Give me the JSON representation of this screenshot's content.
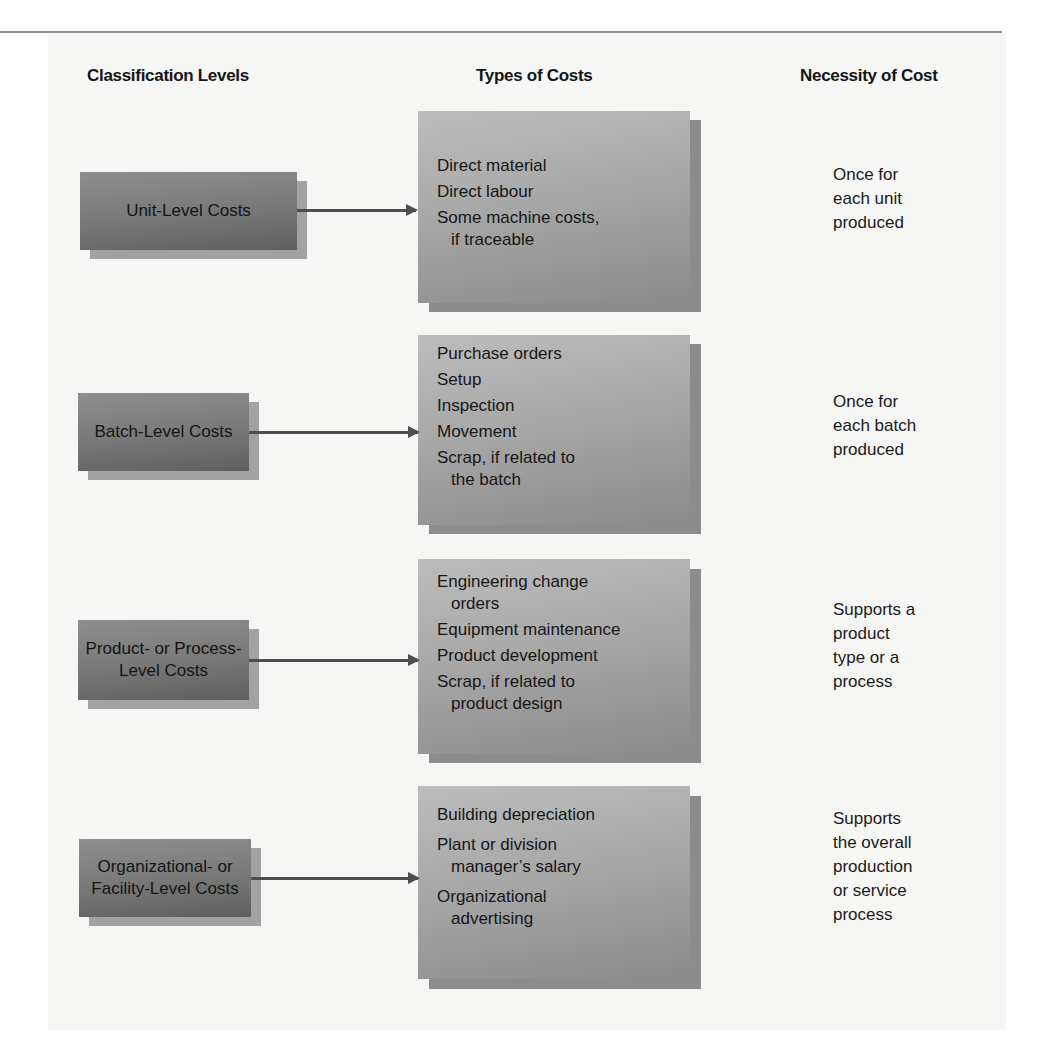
{
  "headers": {
    "classification": "Classification Levels",
    "types": "Types of Costs",
    "necessity": "Necessity of Cost"
  },
  "rows": [
    {
      "level": "Unit-Level Costs",
      "types": [
        {
          "main": "Direct material",
          "cont": ""
        },
        {
          "main": "Direct labour",
          "cont": ""
        },
        {
          "main": "Some machine costs,",
          "cont": "if traceable"
        }
      ],
      "necessity": "Once for\neach unit\nproduced"
    },
    {
      "level": "Batch-Level Costs",
      "types": [
        {
          "main": "Purchase orders",
          "cont": ""
        },
        {
          "main": "Setup",
          "cont": ""
        },
        {
          "main": "Inspection",
          "cont": ""
        },
        {
          "main": "Movement",
          "cont": ""
        },
        {
          "main": "Scrap, if related to",
          "cont": "the batch"
        }
      ],
      "necessity": "Once for\neach batch\nproduced"
    },
    {
      "level": "Product- or Process-\nLevel Costs",
      "level_line1": "Product- or Process-",
      "level_line2": "Level Costs",
      "types": [
        {
          "main": "Engineering change",
          "cont": "orders"
        },
        {
          "main": "Equipment maintenance",
          "cont": ""
        },
        {
          "main": "Product development",
          "cont": ""
        },
        {
          "main": "Scrap, if related to",
          "cont": "product design"
        }
      ],
      "necessity": "Supports a\nproduct\ntype or a\nprocess"
    },
    {
      "level": "Organizational- or\nFacility-Level Costs",
      "level_line1": "Organizational- or",
      "level_line2": "Facility-Level Costs",
      "types": [
        {
          "main": "Building depreciation",
          "cont": ""
        },
        {
          "main": "Plant or division",
          "cont": "manager’s salary"
        },
        {
          "main": "Organizational",
          "cont": "advertising"
        }
      ],
      "necessity": "Supports\nthe overall\nproduction\nor service\nprocess"
    }
  ],
  "colors": {
    "panel": "#f6f6f5",
    "level_box": "#7a7a7a",
    "type_box": "#a8a8a8",
    "arrow": "#4e4e4e"
  }
}
